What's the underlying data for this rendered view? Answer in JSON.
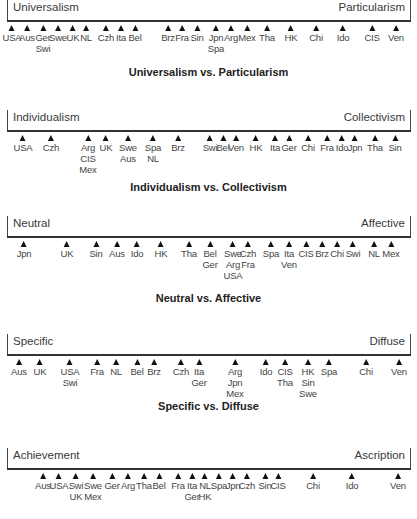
{
  "chart_data": [
    {
      "type": "scatter",
      "title": "Universalism vs. Particularism",
      "pole_left": "Universalism",
      "pole_right": "Particularism",
      "markers": [
        {
          "x": 12,
          "labels": [
            "USA"
          ]
        },
        {
          "x": 27,
          "labels": [
            "Aus"
          ]
        },
        {
          "x": 43,
          "labels": [
            "Ger",
            "Swi"
          ]
        },
        {
          "x": 58,
          "labels": [
            "Swe"
          ]
        },
        {
          "x": 73,
          "labels": [
            "UK"
          ]
        },
        {
          "x": 86,
          "labels": [
            "NL"
          ]
        },
        {
          "x": 106,
          "labels": [
            "Czh"
          ]
        },
        {
          "x": 121,
          "labels": [
            "Ita"
          ]
        },
        {
          "x": 135,
          "labels": [
            "Bel"
          ]
        },
        {
          "x": 168,
          "labels": [
            "Brz"
          ]
        },
        {
          "x": 182,
          "labels": [
            "Fra"
          ]
        },
        {
          "x": 197,
          "labels": [
            "Sin"
          ]
        },
        {
          "x": 216,
          "labels": [
            "Jpn",
            "Spa"
          ]
        },
        {
          "x": 231,
          "labels": [
            "Arg"
          ]
        },
        {
          "x": 247,
          "labels": [
            "Mex"
          ]
        },
        {
          "x": 267,
          "labels": [
            "Tha"
          ]
        },
        {
          "x": 291,
          "labels": [
            "HK"
          ]
        },
        {
          "x": 316,
          "labels": [
            "Chi"
          ]
        },
        {
          "x": 343,
          "labels": [
            "Ido"
          ]
        },
        {
          "x": 372,
          "labels": [
            "CIS"
          ]
        },
        {
          "x": 396,
          "labels": [
            "Ven"
          ]
        }
      ]
    },
    {
      "type": "scatter",
      "title": "Individualism vs. Collectivism",
      "pole_left": "Individualism",
      "pole_right": "Collectivism",
      "markers": [
        {
          "x": 23,
          "labels": [
            "USA"
          ]
        },
        {
          "x": 51,
          "labels": [
            "Czh"
          ]
        },
        {
          "x": 88,
          "labels": [
            "Arg",
            "CIS",
            "Mex"
          ]
        },
        {
          "x": 106,
          "labels": [
            "UK"
          ]
        },
        {
          "x": 128,
          "labels": [
            "Swe",
            "Aus"
          ]
        },
        {
          "x": 153,
          "labels": [
            "Spa",
            "NL"
          ]
        },
        {
          "x": 178,
          "labels": [
            "Brz"
          ]
        },
        {
          "x": 210,
          "labels": [
            "Swi"
          ]
        },
        {
          "x": 223,
          "labels": [
            "Bel"
          ]
        },
        {
          "x": 236,
          "labels": [
            "Ven"
          ]
        },
        {
          "x": 256,
          "labels": [
            "HK"
          ]
        },
        {
          "x": 275,
          "labels": [
            "Ita"
          ]
        },
        {
          "x": 289,
          "labels": [
            "Ger"
          ]
        },
        {
          "x": 308,
          "labels": [
            "Chi"
          ]
        },
        {
          "x": 327,
          "labels": [
            "Fra"
          ]
        },
        {
          "x": 342,
          "labels": [
            "Ido"
          ]
        },
        {
          "x": 355,
          "labels": [
            "Jpn"
          ]
        },
        {
          "x": 375,
          "labels": [
            "Tha"
          ]
        },
        {
          "x": 395,
          "labels": [
            "Sin"
          ]
        }
      ]
    },
    {
      "type": "scatter",
      "title": "Neutral vs. Affective",
      "pole_left": "Neutral",
      "pole_right": "Affective",
      "markers": [
        {
          "x": 24,
          "labels": [
            "Jpn"
          ]
        },
        {
          "x": 67,
          "labels": [
            "UK"
          ]
        },
        {
          "x": 96,
          "labels": [
            "Sin"
          ]
        },
        {
          "x": 117,
          "labels": [
            "Aus"
          ]
        },
        {
          "x": 137,
          "labels": [
            "Ido"
          ]
        },
        {
          "x": 161,
          "labels": [
            "HK"
          ]
        },
        {
          "x": 189,
          "labels": [
            "Tha"
          ]
        },
        {
          "x": 210,
          "labels": [
            "Bel",
            "Ger"
          ]
        },
        {
          "x": 233,
          "labels": [
            "Swe",
            "Arg",
            "USA"
          ]
        },
        {
          "x": 248,
          "labels": [
            "Czh",
            "Fra"
          ]
        },
        {
          "x": 271,
          "labels": [
            "Spa"
          ]
        },
        {
          "x": 289,
          "labels": [
            "Ita",
            "Ven"
          ]
        },
        {
          "x": 306,
          "labels": [
            "CIS"
          ]
        },
        {
          "x": 322,
          "labels": [
            "Brz"
          ]
        },
        {
          "x": 337,
          "labels": [
            "Chi"
          ]
        },
        {
          "x": 353,
          "labels": [
            "Swi"
          ]
        },
        {
          "x": 374,
          "labels": [
            "NL"
          ]
        },
        {
          "x": 391,
          "labels": [
            "Mex"
          ]
        }
      ]
    },
    {
      "type": "scatter",
      "title": "Specific vs. Diffuse",
      "pole_left": "Specific",
      "pole_right": "Diffuse",
      "markers": [
        {
          "x": 19,
          "labels": [
            "Aus"
          ]
        },
        {
          "x": 40,
          "labels": [
            "UK"
          ]
        },
        {
          "x": 70,
          "labels": [
            "USA",
            "Swi"
          ]
        },
        {
          "x": 97,
          "labels": [
            "Fra"
          ]
        },
        {
          "x": 116,
          "labels": [
            "NL"
          ]
        },
        {
          "x": 137,
          "labels": [
            "Bel"
          ]
        },
        {
          "x": 154,
          "labels": [
            "Brz"
          ]
        },
        {
          "x": 181,
          "labels": [
            "Czh"
          ]
        },
        {
          "x": 199,
          "labels": [
            "Ita",
            "Ger"
          ]
        },
        {
          "x": 235,
          "labels": [
            "Arg",
            "Jpn",
            "Mex"
          ]
        },
        {
          "x": 266,
          "labels": [
            "Ido"
          ]
        },
        {
          "x": 285,
          "labels": [
            "CIS",
            "Tha"
          ]
        },
        {
          "x": 308,
          "labels": [
            "HK",
            "Sin",
            "Swe"
          ]
        },
        {
          "x": 329,
          "labels": [
            "Spa"
          ]
        },
        {
          "x": 366,
          "labels": [
            "Chi"
          ]
        },
        {
          "x": 399,
          "labels": [
            "Ven"
          ]
        }
      ]
    },
    {
      "type": "scatter",
      "title": "",
      "pole_left": "Achievement",
      "pole_right": "Ascription",
      "markers": [
        {
          "x": 43,
          "labels": [
            "Aus"
          ]
        },
        {
          "x": 59,
          "labels": [
            "USA"
          ]
        },
        {
          "x": 76,
          "labels": [
            "Swi",
            "UK"
          ]
        },
        {
          "x": 93,
          "labels": [
            "Swe",
            "Mex"
          ]
        },
        {
          "x": 112,
          "labels": [
            "Ger"
          ]
        },
        {
          "x": 128,
          "labels": [
            "Arg"
          ]
        },
        {
          "x": 144,
          "labels": [
            "Tha"
          ]
        },
        {
          "x": 159,
          "labels": [
            "Bel"
          ]
        },
        {
          "x": 178,
          "labels": [
            "Fra"
          ]
        },
        {
          "x": 192,
          "labels": [
            "Ita",
            "Ger"
          ]
        },
        {
          "x": 205,
          "labels": [
            "NL",
            "HK"
          ]
        },
        {
          "x": 219,
          "labels": [
            "Spa"
          ]
        },
        {
          "x": 233,
          "labels": [
            "Jpn"
          ]
        },
        {
          "x": 247,
          "labels": [
            "Czh"
          ]
        },
        {
          "x": 265,
          "labels": [
            "Sin"
          ]
        },
        {
          "x": 278,
          "labels": [
            "CIS"
          ]
        },
        {
          "x": 313,
          "labels": [
            "Chi"
          ]
        },
        {
          "x": 352,
          "labels": [
            "Ido"
          ]
        },
        {
          "x": 398,
          "labels": [
            "Ven"
          ]
        }
      ]
    }
  ],
  "layout": {
    "rows_top": [
      0,
      110,
      216,
      334,
      448
    ],
    "captions_top": [
      66,
      181,
      292,
      400,
      null
    ]
  }
}
